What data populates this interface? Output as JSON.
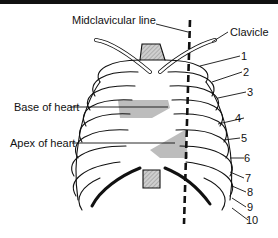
{
  "figure": {
    "labels": {
      "midclavicular": "Midclavicular line",
      "clavicle": "Clavicle",
      "base_heart": "Base of heart",
      "apex_heart": "Apex of heart"
    },
    "ribs": [
      "1",
      "2",
      "3",
      "4",
      "5",
      "6",
      "7",
      "8",
      "9",
      "10"
    ],
    "colors": {
      "ink": "#111111",
      "shade": "#b8b8b8",
      "bg": "#ffffff"
    }
  }
}
